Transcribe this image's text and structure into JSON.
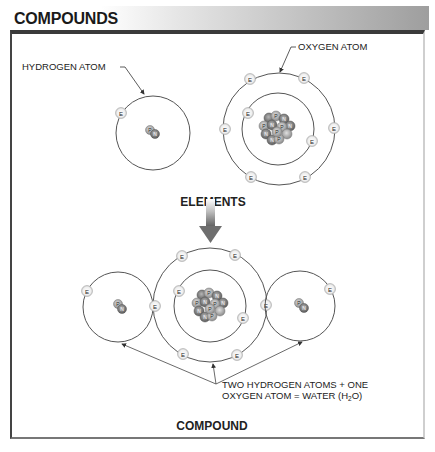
{
  "header": {
    "title": "COMPOUNDS"
  },
  "labels": {
    "hydrogen_atom": "HYDROGEN ATOM",
    "oxygen_atom": "OXYGEN ATOM",
    "elements": "ELEMENTS",
    "compound": "COMPOUND",
    "caption_line1": "TWO HYDROGEN ATOMS + ONE",
    "caption_line2_a": "OXYGEN ATOM = WATER (H",
    "caption_line2_sub": "2",
    "caption_line2_b": "O)"
  },
  "particles": {
    "electron": "E",
    "proton": "P",
    "neutron": "N"
  },
  "colors": {
    "orbit": "#555555",
    "electron_fill": "#e8e8e8",
    "proton_fill": "#bdbdbd",
    "neutron_fill": "#8f8f8f",
    "arrow": "#6e6e6e"
  }
}
